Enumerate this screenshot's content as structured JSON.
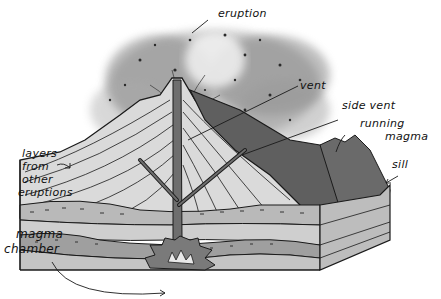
{
  "diagram": {
    "style": "hand-drawn grayscale illustration",
    "labels": {
      "eruption": "eruption",
      "vent": "vent",
      "side_vent": "side vent",
      "running_magma_1": "running",
      "running_magma_2": "magma",
      "sill": "sill",
      "layers_1": "layers",
      "layers_2": "from",
      "layers_3": "other",
      "layers_4": "eruptions",
      "magma_chamber_1": "magma",
      "magma_chamber_2": "chamber"
    },
    "colors": {
      "ink": "#1a1a1a",
      "ash_cloud": "#8a8a8a",
      "ash_light": "#c9c9c9",
      "cone_layers": "#d9d9d9",
      "dark_magma": "#5e5e5e",
      "strata_mid": "#a8a8a8",
      "strata_light": "#cfcfcf",
      "background": "#ffffff"
    }
  }
}
